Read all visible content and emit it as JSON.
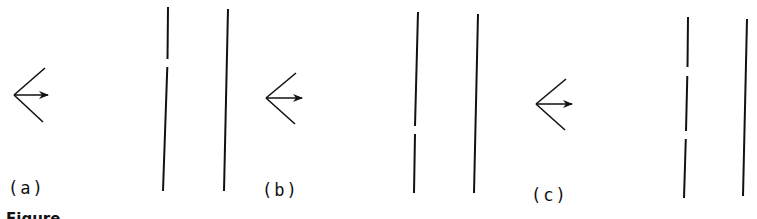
{
  "figure": {
    "caption_partial": "Figure",
    "panels": [
      {
        "label": "(a)",
        "description": "Observer at left with ray arrow; dashed line with one gap near top; solid line to the right",
        "gap_count": 1
      },
      {
        "label": "(b)",
        "description": "Observer at left with ray arrow; dashed line with one gap near bottom; solid line to the right",
        "gap_count": 1
      },
      {
        "label": "(c)",
        "description": "Observer at left with ray arrow; dashed line with two gaps; solid line to the right",
        "gap_count": 2
      }
    ],
    "stroke_color": "#111111",
    "background": "#ffffff"
  }
}
